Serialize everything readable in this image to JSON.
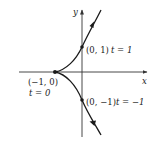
{
  "diagram": {
    "type": "parametric-curve",
    "axes": {
      "x_label": "x",
      "y_label": "y"
    },
    "points": [
      {
        "id": "cusp",
        "coord_label": "(−1, 0)",
        "param_label": "t = 0"
      },
      {
        "id": "upper",
        "coord_label": "(0, 1)",
        "param_label": "t = 1"
      },
      {
        "id": "lower",
        "coord_label": "(0, −1)",
        "param_label": "t = −1"
      }
    ],
    "colors": {
      "curve": "#1a1a1a",
      "axes": "#333333",
      "text": "#222222"
    }
  }
}
